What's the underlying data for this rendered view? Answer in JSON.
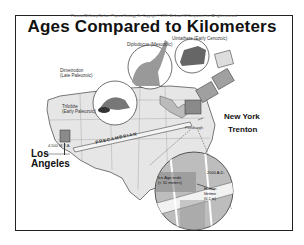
{
  "header": {
    "copyright": "Plummer/McGeary/Carlson: Physical Geology, 8e. Copyright © 1999, McGraw-Hill Companies, Inc. All rights reserved",
    "title": "Ages Compared to  Kilometers"
  },
  "fossils": {
    "diplodocus": "Diplodocus (Mesozoic)",
    "uintatherium": "Uintathere (Early Cenozoic)",
    "dimetrodon_line1": "Dimetrodon",
    "dimetrodon_line2": "(Late Paleozoic)",
    "trilobite_line1": "Trilobite",
    "trilobite_line2": "(Early Paleozoic)"
  },
  "map": {
    "precambrian": "PRECAMBRIAN",
    "start_age": "4,500 M.Y.A.",
    "cities": {
      "los_angeles_line1": "Los",
      "los_angeles_line2": "Angeles",
      "new_york": "New York",
      "trenton": "Trenton",
      "pittsburgh": "Pittsburgh"
    }
  },
  "inset": {
    "ice_age_line1": "Ice Age ends",
    "ice_age_line2": "(≈ 10 meters)",
    "year": "2000 A.D.",
    "human_line1": "Human",
    "human_line2": "lifetime",
    "human_line3": "(0.1 m)"
  },
  "colors": {
    "frame": "#222222",
    "map_fill": "#e6e6e6",
    "map_stroke": "#555555",
    "inset_fill": "#bdbdbd",
    "road": "#f2f2f2"
  }
}
